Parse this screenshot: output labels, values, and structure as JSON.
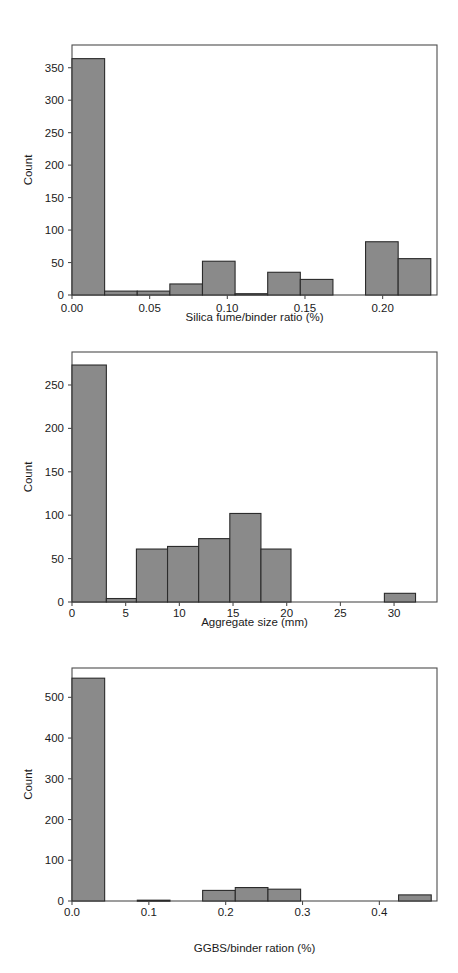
{
  "figure": {
    "background_color": "#ffffff",
    "bar_fill_color": "#8a8a8a",
    "bar_edge_color": "#2b2b2b",
    "axis_color": "#4d4d4d",
    "text_color": "#1a1a1a"
  },
  "panels": [
    {
      "id": "panel-silica-fume",
      "ylabel": "Count",
      "xlabel": "Silica fume/binder ratio (%)",
      "xticks": [
        "0.00",
        "0.05",
        "0.10",
        "0.15",
        "0.20"
      ],
      "yticks": [
        "0",
        "50",
        "100",
        "150",
        "200",
        "250",
        "300",
        "350"
      ]
    },
    {
      "id": "panel-aggregate-size",
      "ylabel": "Count",
      "xlabel": "Aggregate size (mm)",
      "xticks": [
        "0",
        "5",
        "10",
        "15",
        "20",
        "25",
        "30"
      ],
      "yticks": [
        "0",
        "50",
        "100",
        "150",
        "200",
        "250"
      ]
    },
    {
      "id": "panel-ggbs",
      "ylabel": "Count",
      "xlabel": "GGBS/binder ration (%)",
      "xticks": [
        "0.0",
        "0.1",
        "0.2",
        "0.3",
        "0.4"
      ],
      "yticks": [
        "0",
        "100",
        "200",
        "300",
        "400",
        "500"
      ]
    }
  ],
  "chart_data": [
    {
      "type": "bar",
      "id": "silica-fume-histogram",
      "title": "",
      "xlabel": "Silica fume/binder ratio (%)",
      "ylabel": "Count",
      "grid": false,
      "legend": "none",
      "xlim": [
        0.0,
        0.235
      ],
      "ylim": [
        0,
        385
      ],
      "xtick_values": [
        0.0,
        0.05,
        0.1,
        0.15,
        0.2
      ],
      "xtick_labels": [
        "0.00",
        "0.05",
        "0.10",
        "0.15",
        "0.20"
      ],
      "ytick_values": [
        0,
        50,
        100,
        150,
        200,
        250,
        300,
        350
      ],
      "ytick_labels": [
        "0",
        "50",
        "100",
        "150",
        "200",
        "250",
        "300",
        "350"
      ],
      "bin_edges": [
        0.0,
        0.021,
        0.042,
        0.063,
        0.084,
        0.105,
        0.126,
        0.147,
        0.168,
        0.189,
        0.21,
        0.231
      ],
      "categories": [
        "0.000-0.021",
        "0.021-0.042",
        "0.042-0.063",
        "0.063-0.084",
        "0.084-0.105",
        "0.105-0.126",
        "0.126-0.147",
        "0.147-0.168",
        "0.168-0.189",
        "0.189-0.210",
        "0.210-0.231"
      ],
      "values": [
        364,
        6,
        6,
        17,
        52,
        2,
        35,
        24,
        0,
        82,
        56
      ]
    },
    {
      "type": "bar",
      "id": "aggregate-size-histogram",
      "title": "",
      "xlabel": "Aggregate size (mm)",
      "ylabel": "Count",
      "grid": false,
      "legend": "none",
      "xlim": [
        0.0,
        34.0
      ],
      "ylim": [
        0,
        288
      ],
      "xtick_values": [
        0,
        5,
        10,
        15,
        20,
        25,
        30
      ],
      "xtick_labels": [
        "0",
        "5",
        "10",
        "15",
        "20",
        "25",
        "30"
      ],
      "ytick_values": [
        0,
        50,
        100,
        150,
        200,
        250
      ],
      "ytick_labels": [
        "0",
        "50",
        "100",
        "150",
        "200",
        "250"
      ],
      "bin_edges": [
        0.0,
        3.2,
        6.0,
        8.9,
        11.8,
        14.7,
        17.6,
        20.4,
        23.3,
        26.2,
        29.1,
        32.0
      ],
      "categories": [
        "0.0-3.2",
        "3.2-6.0",
        "6.0-8.9",
        "8.9-11.8",
        "11.8-14.7",
        "14.7-17.6",
        "17.6-20.4",
        "20.4-23.3",
        "23.3-26.2",
        "26.2-29.1",
        "29.1-32.0"
      ],
      "values": [
        273,
        4,
        61,
        64,
        73,
        102,
        61,
        0,
        0,
        0,
        10
      ]
    },
    {
      "type": "bar",
      "id": "ggbs-histogram",
      "title": "",
      "xlabel": "GGBS/binder ration (%)",
      "ylabel": "Count",
      "grid": false,
      "legend": "none",
      "xlim": [
        0.0,
        0.475
      ],
      "ylim": [
        0,
        572
      ],
      "xtick_values": [
        0.0,
        0.1,
        0.2,
        0.3,
        0.4
      ],
      "xtick_labels": [
        "0.0",
        "0.1",
        "0.2",
        "0.3",
        "0.4"
      ],
      "ytick_values": [
        0,
        100,
        200,
        300,
        400,
        500
      ],
      "ytick_labels": [
        "0",
        "100",
        "200",
        "300",
        "400",
        "500"
      ],
      "bin_edges": [
        0.0,
        0.0425,
        0.085,
        0.1275,
        0.17,
        0.2125,
        0.255,
        0.2975,
        0.34,
        0.3825,
        0.425,
        0.4675
      ],
      "categories": [
        "0.0000-0.0425",
        "0.0425-0.0850",
        "0.0850-0.1275",
        "0.1275-0.1700",
        "0.1700-0.2125",
        "0.2125-0.2550",
        "0.2550-0.2975",
        "0.2975-0.3400",
        "0.3400-0.3825",
        "0.3825-0.4250",
        "0.4250-0.4675"
      ],
      "values": [
        547,
        0,
        2,
        0,
        26,
        33,
        29,
        0,
        0,
        0,
        15
      ]
    }
  ]
}
